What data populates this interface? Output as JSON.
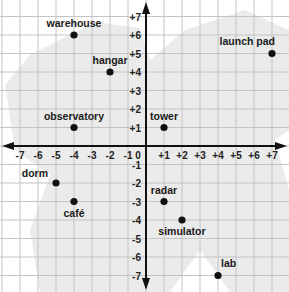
{
  "map": {
    "width": 289,
    "height": 292,
    "origin_px": [
      146,
      146
    ],
    "unit_px_x": 18.0,
    "unit_px_y": 18.5,
    "range": {
      "x": [
        -7,
        7
      ],
      "y": [
        -7,
        7
      ]
    },
    "colors": {
      "background": "#ffffff",
      "region": "#ebebeb",
      "grid": "#c4c4c4",
      "axis": "#111111",
      "point": "#111111",
      "text": "#1a1a1a"
    },
    "x_ticks": [
      "-7",
      "-6",
      "-5",
      "-4",
      "-3",
      "-2",
      "-1",
      "0",
      "+1",
      "+2",
      "+3",
      "+4",
      "+5",
      "+6",
      "+7"
    ],
    "y_ticks": [
      "+7",
      "+6",
      "+5",
      "+4",
      "+3",
      "+2",
      "+1",
      "-1",
      "-2",
      "-3",
      "-4",
      "-5",
      "-6",
      "-7"
    ]
  },
  "points": [
    {
      "name": "warehouse",
      "x": -4,
      "y": 6,
      "label_pos": "above"
    },
    {
      "name": "hangar",
      "x": -2,
      "y": 4,
      "label_pos": "above"
    },
    {
      "name": "observatory",
      "x": -4,
      "y": 1,
      "label_pos": "above"
    },
    {
      "name": "tower",
      "x": 1,
      "y": 1,
      "label_pos": "above"
    },
    {
      "name": "launch pad",
      "x": 7,
      "y": 5,
      "label_pos": "above-left"
    },
    {
      "name": "dorm",
      "x": -5,
      "y": -2,
      "label_pos": "above-left"
    },
    {
      "name": "café",
      "x": -4,
      "y": -3,
      "label_pos": "below"
    },
    {
      "name": "radar",
      "x": 1,
      "y": -3,
      "label_pos": "above"
    },
    {
      "name": "simulator",
      "x": 2,
      "y": -4,
      "label_pos": "below"
    },
    {
      "name": "lab",
      "x": 4,
      "y": -7,
      "label_pos": "above-right"
    }
  ]
}
